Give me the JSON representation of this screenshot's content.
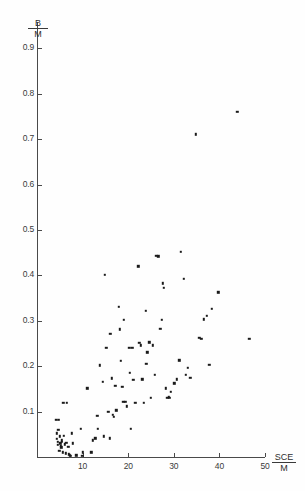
{
  "chart_data": {
    "type": "scatter",
    "title": "",
    "subtitle": "",
    "xlabel": "SCE/M",
    "ylabel": "B/M",
    "xlabel_numerator": "SCE",
    "xlabel_denominator": "M",
    "ylabel_numerator": "B",
    "ylabel_denominator": "M",
    "xlim": [
      0,
      50
    ],
    "ylim": [
      0,
      0.95
    ],
    "xticks": [
      10,
      20,
      30,
      40,
      50
    ],
    "xtick_labels": [
      "10",
      "20",
      "30",
      "40",
      "50"
    ],
    "yticks": [
      0.1,
      0.2,
      0.3,
      0.4,
      0.5,
      0.6,
      0.7,
      0.8,
      0.9
    ],
    "ytick_labels": [
      "0.1",
      "0.2",
      "0.3",
      "0.4",
      "0.5",
      "0.6",
      "0.7",
      "0.8",
      "0.9"
    ],
    "grid": false,
    "legend": false,
    "legend_position": "none",
    "marker": "square",
    "marker_color": "#1a1a1a",
    "n_points": 104,
    "points": [
      [
        4.2,
        0.082
      ],
      [
        4.8,
        0.082
      ],
      [
        4.3,
        0.052
      ],
      [
        4.4,
        0.04
      ],
      [
        4.5,
        0.034
      ],
      [
        4.6,
        0.027
      ],
      [
        5.0,
        0.046
      ],
      [
        5.1,
        0.03
      ],
      [
        5.2,
        0.024
      ],
      [
        5.3,
        0.021
      ],
      [
        4.9,
        0.013
      ],
      [
        5.6,
        0.01
      ],
      [
        5.8,
        0.119
      ],
      [
        6.6,
        0.119
      ],
      [
        5.9,
        0.047
      ],
      [
        6.1,
        0.028
      ],
      [
        6.4,
        0.031
      ],
      [
        6.3,
        0.008
      ],
      [
        7.0,
        0.006
      ],
      [
        7.2,
        0.004
      ],
      [
        7.6,
        0.052
      ],
      [
        7.9,
        0.03
      ],
      [
        8.6,
        0.004
      ],
      [
        9.6,
        0.062
      ],
      [
        10.1,
        0.01
      ],
      [
        11.0,
        0.151
      ],
      [
        11.9,
        0.01
      ],
      [
        12.2,
        0.037
      ],
      [
        13.2,
        0.091
      ],
      [
        13.4,
        0.062
      ],
      [
        13.8,
        0.202
      ],
      [
        14.4,
        0.165
      ],
      [
        14.6,
        0.046
      ],
      [
        14.9,
        0.401
      ],
      [
        15.2,
        0.241
      ],
      [
        15.6,
        0.1
      ],
      [
        16.1,
        0.272
      ],
      [
        16.4,
        0.173
      ],
      [
        16.6,
        0.093
      ],
      [
        17.2,
        0.157
      ],
      [
        17.4,
        0.103
      ],
      [
        18.0,
        0.331
      ],
      [
        18.2,
        0.281
      ],
      [
        18.4,
        0.212
      ],
      [
        18.7,
        0.155
      ],
      [
        18.9,
        0.121
      ],
      [
        19.1,
        0.302
      ],
      [
        19.4,
        0.122
      ],
      [
        19.7,
        0.112
      ],
      [
        20.2,
        0.241
      ],
      [
        20.4,
        0.186
      ],
      [
        20.6,
        0.062
      ],
      [
        21.1,
        0.17
      ],
      [
        21.6,
        0.12
      ],
      [
        22.2,
        0.42
      ],
      [
        22.4,
        0.252
      ],
      [
        22.8,
        0.246
      ],
      [
        23.1,
        0.171
      ],
      [
        23.4,
        0.119
      ],
      [
        23.8,
        0.322
      ],
      [
        24.2,
        0.231
      ],
      [
        24.6,
        0.253
      ],
      [
        24.9,
        0.131
      ],
      [
        25.4,
        0.246
      ],
      [
        25.8,
        0.181
      ],
      [
        26.2,
        0.443
      ],
      [
        26.6,
        0.442
      ],
      [
        27.0,
        0.282
      ],
      [
        27.4,
        0.302
      ],
      [
        27.6,
        0.383
      ],
      [
        27.8,
        0.373
      ],
      [
        28.2,
        0.151
      ],
      [
        28.6,
        0.131
      ],
      [
        29.0,
        0.131
      ],
      [
        29.3,
        0.144
      ],
      [
        30.1,
        0.162
      ],
      [
        30.6,
        0.171
      ],
      [
        31.2,
        0.213
      ],
      [
        31.6,
        0.452
      ],
      [
        32.2,
        0.392
      ],
      [
        32.6,
        0.181
      ],
      [
        33.1,
        0.196
      ],
      [
        34.8,
        0.711
      ],
      [
        35.6,
        0.262
      ],
      [
        36.6,
        0.303
      ],
      [
        37.2,
        0.311
      ],
      [
        37.8,
        0.203
      ],
      [
        38.4,
        0.326
      ],
      [
        39.8,
        0.363
      ],
      [
        43.9,
        0.761
      ],
      [
        46.6,
        0.261
      ],
      [
        5.4,
        0.037
      ],
      [
        5.5,
        0.033
      ],
      [
        4.7,
        0.06
      ],
      [
        6.9,
        0.022
      ],
      [
        7.4,
        0.002
      ],
      [
        9.9,
        0.003
      ],
      [
        12.8,
        0.041
      ],
      [
        15.9,
        0.041
      ],
      [
        16.9,
        0.089
      ],
      [
        20.9,
        0.24
      ],
      [
        24.0,
        0.205
      ],
      [
        28.9,
        0.133
      ],
      [
        33.6,
        0.174
      ],
      [
        36.0,
        0.26
      ]
    ]
  },
  "figure": {
    "background_color": "#fefefe",
    "axis_color": "#4a4a4a",
    "text_color": "#2f2f2f"
  }
}
